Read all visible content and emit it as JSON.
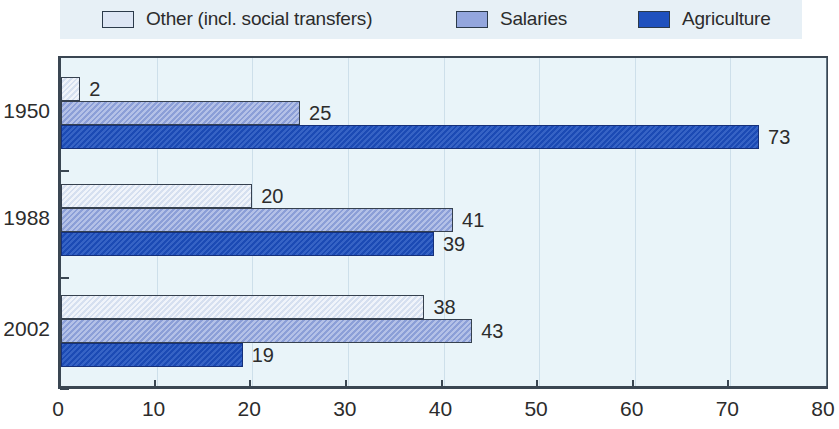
{
  "chart_data": {
    "type": "bar",
    "orientation": "horizontal",
    "title": "",
    "xlabel": "",
    "ylabel": "",
    "xlim": [
      0,
      80
    ],
    "xticks": [
      0,
      10,
      20,
      30,
      40,
      50,
      60,
      70,
      80
    ],
    "grid": true,
    "legend_position": "top",
    "categories": [
      "1950",
      "1988",
      "2002"
    ],
    "series": [
      {
        "name": "Other (incl. social transfers)",
        "color": "#dde6f4",
        "values": [
          2,
          20,
          38
        ],
        "labels": [
          "2",
          "20",
          "38"
        ]
      },
      {
        "name": "Salaries",
        "color": "#93a6dd",
        "values": [
          25,
          41,
          43
        ],
        "labels": [
          "25",
          "41",
          "43"
        ]
      },
      {
        "name": "Agriculture",
        "color": "#1f51be",
        "values": [
          73,
          39,
          19
        ],
        "labels": [
          "73",
          "39",
          "19"
        ]
      }
    ]
  },
  "legend": {
    "items": [
      {
        "label": "Other (incl. social transfers)",
        "swatch_color": "#dde6f4",
        "icon": "legend-swatch-icon"
      },
      {
        "label": "Salaries",
        "swatch_color": "#93a6dd",
        "icon": "legend-swatch-icon"
      },
      {
        "label": "Agriculture",
        "swatch_color": "#1f51be",
        "icon": "legend-swatch-icon"
      }
    ]
  },
  "axis": {
    "x_tick_labels": [
      "0",
      "10",
      "20",
      "30",
      "40",
      "50",
      "60",
      "70",
      "80"
    ],
    "y_group_labels": [
      "1950",
      "1988",
      "2002"
    ]
  },
  "colors": {
    "plot_background": "#e9f4f9",
    "legend_background": "#e7f0f6",
    "axis_line": "#3a4652",
    "text": "#2c2c2c"
  }
}
